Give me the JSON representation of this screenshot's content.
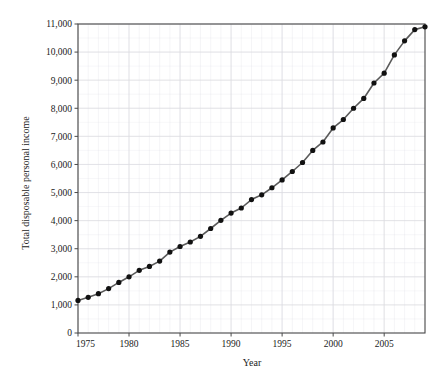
{
  "chart_data": {
    "type": "line",
    "title": "",
    "subtitle": "",
    "xlabel": "Year",
    "ylabel": "Total disposable personal income",
    "xlim": [
      1975,
      2009
    ],
    "ylim": [
      0,
      11000
    ],
    "grid": true,
    "legend": null,
    "x_major_ticks": [
      1975,
      1980,
      1985,
      1990,
      1995,
      2000,
      2005
    ],
    "x_major_tick_labels": [
      "1975",
      "1980",
      "1985",
      "1990",
      "1995",
      "2000",
      "2005"
    ],
    "x_minor_tick_step": 1,
    "y_major_ticks": [
      0,
      1000,
      2000,
      3000,
      4000,
      5000,
      6000,
      7000,
      8000,
      9000,
      10000,
      11000
    ],
    "y_major_tick_labels": [
      "0",
      "1,000",
      "2,000",
      "3,000",
      "4,000",
      "5,000",
      "6,000",
      "7,000",
      "8,000",
      "9,000",
      "10,000",
      "11,000"
    ],
    "y_minor_tick_step": 500,
    "marker": "filled-circle",
    "marker_color": "#111111",
    "line_color": "#5a5a5a",
    "grid_color": "#dcdce2",
    "axis_color": "#4a4a4a",
    "series": [
      {
        "name": "Total disposable personal income",
        "x": [
          1975,
          1976,
          1977,
          1978,
          1979,
          1980,
          1981,
          1982,
          1983,
          1984,
          1985,
          1986,
          1987,
          1988,
          1989,
          1990,
          1991,
          1992,
          1993,
          1994,
          1995,
          1996,
          1997,
          1998,
          1999,
          2000,
          2001,
          2002,
          2003,
          2004,
          2005,
          2006,
          2007,
          2008,
          2009
        ],
        "values": [
          1160,
          1270,
          1400,
          1580,
          1800,
          2000,
          2230,
          2370,
          2560,
          2880,
          3080,
          3240,
          3440,
          3720,
          4010,
          4270,
          4450,
          4750,
          4920,
          5170,
          5450,
          5750,
          6070,
          6500,
          6800,
          7300,
          7600,
          8000,
          8350,
          8900,
          9250,
          9900,
          10400,
          10800,
          10900
        ]
      }
    ]
  },
  "axis_titles": {
    "x": "Year",
    "y": "Total disposable personal income"
  }
}
